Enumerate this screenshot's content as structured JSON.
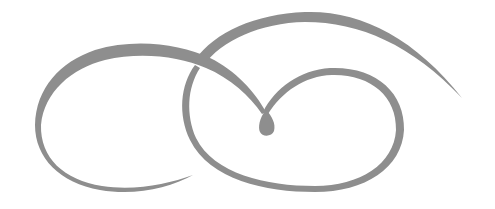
{
  "image": {
    "description": "Decorative calligraphic flourish ornament with two interlocking loops and a central teardrop",
    "background": "#ffffff",
    "ink_color": "#8e8e8e",
    "elements": [
      {
        "name": "left-loop",
        "kind": "swash"
      },
      {
        "name": "right-loop",
        "kind": "swash"
      },
      {
        "name": "upper-arc",
        "kind": "swash-tail"
      },
      {
        "name": "center-teardrop",
        "kind": "terminal"
      }
    ]
  }
}
